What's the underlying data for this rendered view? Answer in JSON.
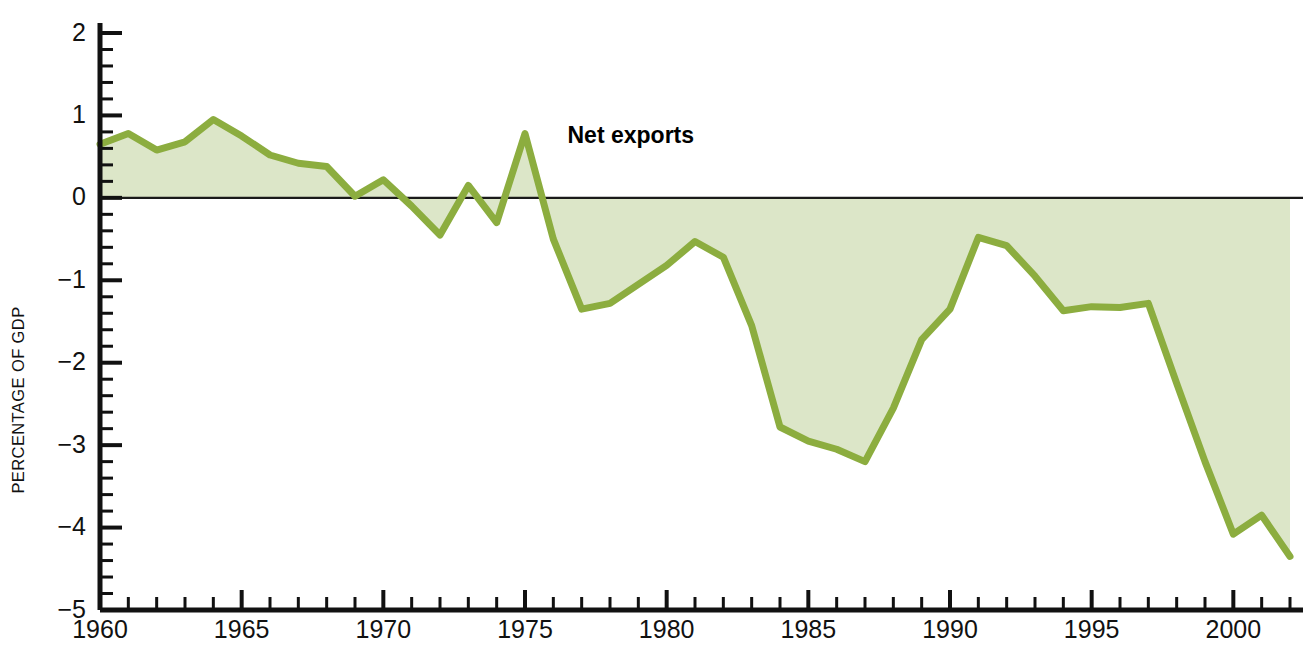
{
  "chart_data": {
    "type": "area",
    "title": "",
    "xlabel": "",
    "ylabel": "PERCENTAGE OF GDP",
    "xlim": [
      1960,
      2002
    ],
    "ylim": [
      -5,
      2
    ],
    "grid": false,
    "legend_position": "inline-annotation",
    "baseline": 0,
    "y_major_step": 1,
    "y_minor_step": 0.2,
    "x_major_step": 5,
    "x_minor_step": 1,
    "ytick_labels": [
      "2",
      "1",
      "0",
      "−1",
      "−2",
      "−3",
      "−4",
      "−5"
    ],
    "ytick_values": [
      2,
      1,
      0,
      -1,
      -2,
      -3,
      -4,
      -5
    ],
    "xtick_labels": [
      "1960",
      "1965",
      "1970",
      "1975",
      "1980",
      "1985",
      "1990",
      "1995",
      "2000"
    ],
    "xtick_values": [
      1960,
      1965,
      1970,
      1975,
      1980,
      1985,
      1990,
      1995,
      2000
    ],
    "annotations": [
      {
        "text": "Net exports",
        "x": 1976.5,
        "y": 0.76
      }
    ],
    "series": [
      {
        "name": "Net exports",
        "line_color": "#8CAD3F",
        "fill_color": "#DCE6C8",
        "x": [
          1960,
          1961,
          1962,
          1963,
          1964,
          1965,
          1966,
          1967,
          1968,
          1969,
          1970,
          1971,
          1972,
          1973,
          1974,
          1975,
          1976,
          1977,
          1978,
          1979,
          1980,
          1981,
          1982,
          1983,
          1984,
          1985,
          1986,
          1987,
          1988,
          1989,
          1990,
          1991,
          1992,
          1993,
          1994,
          1995,
          1996,
          1997,
          1998,
          1999,
          2000,
          2001,
          2002
        ],
        "values": [
          0.65,
          0.78,
          0.58,
          0.68,
          0.95,
          0.75,
          0.52,
          0.42,
          0.38,
          0.02,
          0.22,
          -0.1,
          -0.45,
          0.15,
          -0.3,
          0.78,
          -0.5,
          -1.35,
          -1.28,
          -1.05,
          -0.82,
          -0.53,
          -0.72,
          -1.55,
          -2.78,
          -2.95,
          -3.05,
          -3.2,
          -2.55,
          -1.72,
          -1.35,
          -0.48,
          -0.58,
          -0.95,
          -1.37,
          -1.32,
          -1.33,
          -1.28,
          -2.25,
          -3.2,
          -4.08,
          -3.85,
          -4.35
        ]
      }
    ]
  }
}
